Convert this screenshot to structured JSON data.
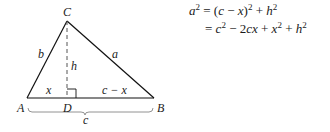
{
  "figure": {
    "vertices": {
      "A": "A",
      "B": "B",
      "C": "C",
      "D": "D"
    },
    "sides": {
      "b": "b",
      "a": "a",
      "h": "h",
      "x": "x",
      "c_minus_x": "c − x",
      "c": "c"
    }
  },
  "equations": {
    "line1": {
      "lhs_var": "a",
      "lhs_exp": "2",
      "eq": " = (",
      "c": "c",
      "minus": " − ",
      "x": "x",
      "close": ")",
      "exp1": "2",
      "plus": " + ",
      "h": "h",
      "exp2": "2"
    },
    "line2": {
      "eq": "= ",
      "c": "c",
      "exp1": "2",
      "minus": " − 2",
      "cx": "cx",
      "plus1": " + ",
      "x": "x",
      "exp2": "2",
      "plus2": " + ",
      "h": "h",
      "exp3": "2"
    }
  }
}
